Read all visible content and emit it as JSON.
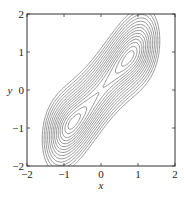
{
  "chart_data": {
    "type": "contour",
    "title": "",
    "xlabel": "x",
    "ylabel": "y",
    "xlim": [
      -2,
      2
    ],
    "ylim": [
      -2,
      2
    ],
    "x_ticks": [
      -2,
      -1,
      0,
      1,
      2
    ],
    "y_ticks": [
      -2,
      -1,
      0,
      1,
      2
    ],
    "x_tick_labels": [
      "−2",
      "−1",
      "0",
      "1",
      "2"
    ],
    "y_tick_labels": [
      "−2",
      "−1",
      "0",
      "1",
      "2"
    ],
    "grid": false,
    "legend": null,
    "line_color": "#7a7a7a",
    "frame_color": "#333333",
    "modeled_function": {
      "note": "Approximate landscape fitted by eye to the rendered contours; this formula does not appear in the figure. Sheared double well whose band saturates near y=±1.5",
      "form": "V(x,y) = a*(y - b*tanh(c*x))^2 + d*(x^2 - e)^2 + f*x*y",
      "params": {
        "a": 3.0,
        "b": 1.45,
        "c": 0.9,
        "d": 1.0,
        "e": 0.55,
        "f": 0.0
      }
    },
    "minima_approx": [
      [
        0.7,
        0.65
      ],
      [
        -0.7,
        -0.75
      ]
    ],
    "saddle_approx": [
      0.0,
      0.0
    ],
    "levels": [
      0.06,
      0.16,
      0.3,
      0.45,
      0.62,
      0.82,
      1.05,
      1.3,
      1.6,
      1.95,
      2.35,
      2.8,
      3.3,
      3.9
    ]
  },
  "axis": {
    "xlabel": "x",
    "ylabel": "y"
  }
}
